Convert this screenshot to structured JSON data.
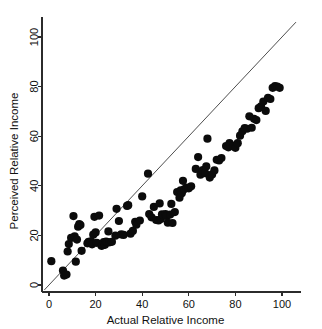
{
  "chart_data": {
    "type": "scatter",
    "title": "",
    "xlabel": "Actual Relative Income",
    "ylabel": "Perceived Relative Income",
    "xlim": [
      0,
      108
    ],
    "ylim": [
      0,
      108
    ],
    "xticks": [
      0,
      20,
      40,
      60,
      80,
      100
    ],
    "yticks": [
      0,
      20,
      40,
      60,
      80,
      100
    ],
    "xtick_labels": [
      "0",
      "20",
      "40",
      "60",
      "80",
      "100"
    ],
    "ytick_labels": [
      "0",
      "20",
      "40",
      "60",
      "80",
      "100"
    ],
    "grid": false,
    "legend": null,
    "marker": "filled-circle",
    "marker_color": "#0b0b0b",
    "marker_size": 4.1,
    "annotations": [
      {
        "name": "identity-reference-line",
        "type": "line",
        "description": "45 degree y = x reference line",
        "x": [
          -2,
          106
        ],
        "y": [
          -2,
          106
        ],
        "color": "#3a3a3a"
      }
    ],
    "series": [
      {
        "name": "Perceived vs Actual Relative Income",
        "points": [
          [
            1,
            9.6
          ],
          [
            6,
            5.8
          ],
          [
            6.5,
            3.8
          ],
          [
            7.5,
            4.2
          ],
          [
            8,
            13.5
          ],
          [
            8.5,
            16.5
          ],
          [
            9.5,
            19.0
          ],
          [
            10.5,
            27.8
          ],
          [
            11,
            19.6
          ],
          [
            11.5,
            9.4
          ],
          [
            12,
            18.3
          ],
          [
            12.5,
            23.5
          ],
          [
            13,
            24.6
          ],
          [
            13.5,
            24.2
          ],
          [
            14,
            13.8
          ],
          [
            16.5,
            16.8
          ],
          [
            17,
            17.4
          ],
          [
            17.5,
            17.0
          ],
          [
            18,
            17.6
          ],
          [
            18.5,
            16.4
          ],
          [
            19,
            20.3
          ],
          [
            19.5,
            27.5
          ],
          [
            20,
            21.2
          ],
          [
            20.5,
            17.0
          ],
          [
            21.5,
            28.0
          ],
          [
            22.5,
            15.8
          ],
          [
            23,
            16.0
          ],
          [
            23.5,
            17.3
          ],
          [
            24,
            16.2
          ],
          [
            24.5,
            17.5
          ],
          [
            25,
            17.2
          ],
          [
            25.5,
            21.6
          ],
          [
            26,
            17.2
          ],
          [
            27,
            17.4
          ],
          [
            28.5,
            19.9
          ],
          [
            29,
            30.7
          ],
          [
            30,
            25.8
          ],
          [
            31,
            20.4
          ],
          [
            32,
            20.2
          ],
          [
            33.5,
            31.9
          ],
          [
            34,
            32.2
          ],
          [
            35,
            20.7
          ],
          [
            36,
            21.8
          ],
          [
            37,
            25.5
          ],
          [
            37.5,
            24.3
          ],
          [
            39,
            26.0
          ],
          [
            40,
            35.7
          ],
          [
            42.5,
            44.9
          ],
          [
            43,
            28.6
          ],
          [
            44,
            27.3
          ],
          [
            45,
            31.5
          ],
          [
            46,
            26.2
          ],
          [
            47,
            26.0
          ],
          [
            47.5,
            32.9
          ],
          [
            48,
            26.6
          ],
          [
            48.5,
            28.5
          ],
          [
            49,
            28.2
          ],
          [
            50,
            28.6
          ],
          [
            50.5,
            27.8
          ],
          [
            51,
            25.1
          ],
          [
            52,
            28.4
          ],
          [
            52.5,
            32.7
          ],
          [
            53,
            25.0
          ],
          [
            54,
            29.4
          ],
          [
            55,
            37.5
          ],
          [
            56,
            35.2
          ],
          [
            56.5,
            38.2
          ],
          [
            57,
            37.0
          ],
          [
            57.5,
            42.0
          ],
          [
            58,
            38.6
          ],
          [
            59,
            39.3
          ],
          [
            60,
            39.0
          ],
          [
            61,
            39.8
          ],
          [
            63,
            46.8
          ],
          [
            64,
            51.6
          ],
          [
            65,
            44.5
          ],
          [
            66,
            46.3
          ],
          [
            67,
            45.1
          ],
          [
            67.5,
            47.8
          ],
          [
            68,
            59.0
          ],
          [
            69,
            43.3
          ],
          [
            70,
            44.6
          ],
          [
            71,
            46.2
          ],
          [
            72,
            50.5
          ],
          [
            73,
            50.2
          ],
          [
            74,
            51.2
          ],
          [
            76,
            56.0
          ],
          [
            77,
            55.5
          ],
          [
            77.5,
            57.2
          ],
          [
            78,
            56.4
          ],
          [
            79,
            56.0
          ],
          [
            80,
            55.3
          ],
          [
            81,
            57.2
          ],
          [
            82,
            60.2
          ],
          [
            83,
            62.0
          ],
          [
            84,
            63.3
          ],
          [
            85,
            63.0
          ],
          [
            86,
            68.0
          ],
          [
            87,
            63.4
          ],
          [
            88,
            67.0
          ],
          [
            89,
            66.5
          ],
          [
            90,
            71.3
          ],
          [
            91,
            72.0
          ],
          [
            92,
            74.0
          ],
          [
            93,
            70.2
          ],
          [
            94,
            75.5
          ],
          [
            95,
            75.0
          ],
          [
            96,
            79.5
          ],
          [
            97,
            80.2
          ],
          [
            98,
            80.0
          ],
          [
            99,
            79.5
          ]
        ]
      }
    ]
  }
}
